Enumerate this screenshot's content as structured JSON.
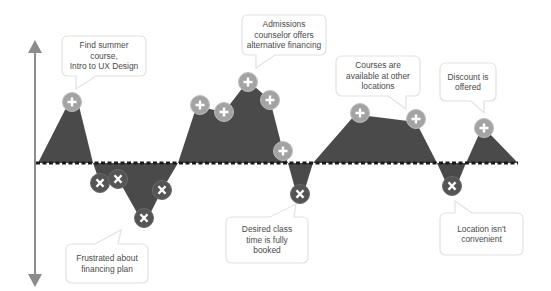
{
  "diagram": {
    "type": "customer-journey-emotion-map",
    "colors": {
      "area_fill": "#4a4a4a",
      "positive_marker": "#a3a3a3",
      "negative_marker": "#555555",
      "axis": "#8c8c8c",
      "baseline": "#1a1a1a",
      "callout_border": "#e2e2e2",
      "callout_text": "#4a4a4a"
    },
    "axis": {
      "label": "",
      "direction": "vertical-bidirectional"
    },
    "positive_events": [
      {
        "id": "p1",
        "symbol": "+",
        "x": 72,
        "y": 102
      },
      {
        "id": "p2",
        "symbol": "+",
        "x": 200,
        "y": 105
      },
      {
        "id": "p3",
        "symbol": "+",
        "x": 224,
        "y": 112
      },
      {
        "id": "p4",
        "symbol": "+",
        "x": 248,
        "y": 82
      },
      {
        "id": "p5",
        "symbol": "+",
        "x": 270,
        "y": 100
      },
      {
        "id": "p6",
        "symbol": "+",
        "x": 283,
        "y": 151
      },
      {
        "id": "p7",
        "symbol": "+",
        "x": 360,
        "y": 113
      },
      {
        "id": "p8",
        "symbol": "+",
        "x": 416,
        "y": 119
      },
      {
        "id": "p9",
        "symbol": "+",
        "x": 484,
        "y": 128
      }
    ],
    "negative_events": [
      {
        "id": "n1",
        "symbol": "x",
        "x": 100,
        "y": 183
      },
      {
        "id": "n2",
        "symbol": "x",
        "x": 118,
        "y": 179
      },
      {
        "id": "n3",
        "symbol": "x",
        "x": 144,
        "y": 218
      },
      {
        "id": "n4",
        "symbol": "x",
        "x": 162,
        "y": 190
      },
      {
        "id": "n5",
        "symbol": "x",
        "x": 300,
        "y": 194
      },
      {
        "id": "n6",
        "symbol": "x",
        "x": 452,
        "y": 186
      }
    ],
    "callouts": [
      {
        "id": "c1",
        "text": "Find summer course, Intro to UX Design",
        "lines": [
          "Find summer course,",
          "Intro to UX Design"
        ],
        "sentiment": "positive"
      },
      {
        "id": "c2",
        "text": "Admissions counselor offers alternative financing",
        "lines": [
          "Admissions",
          "counselor offers",
          "alternative financing"
        ],
        "sentiment": "positive"
      },
      {
        "id": "c3",
        "text": "Courses are available at other locations",
        "lines": [
          "Courses are",
          "available at other",
          "locations"
        ],
        "sentiment": "positive"
      },
      {
        "id": "c4",
        "text": "Discount is offered",
        "lines": [
          "Discount is",
          "offered"
        ],
        "sentiment": "positive"
      },
      {
        "id": "c5",
        "text": "Frustrated about financing plan",
        "lines": [
          "Frustrated about",
          "financing plan"
        ],
        "sentiment": "negative"
      },
      {
        "id": "c6",
        "text": "Desired class time is fully booked",
        "lines": [
          "Desired class",
          "time is fully",
          "booked"
        ],
        "sentiment": "negative"
      },
      {
        "id": "c7",
        "text": "Location isn't convenient",
        "lines": [
          "Location isn't",
          "convenient"
        ],
        "sentiment": "negative"
      }
    ]
  }
}
